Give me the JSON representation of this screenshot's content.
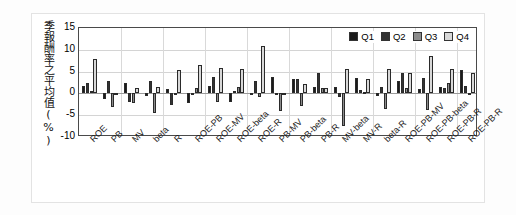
{
  "chart_data": {
    "type": "bar",
    "title": "",
    "xlabel": "",
    "ylabel": "季報酬率之平均值(%)",
    "ylim": [
      -10,
      15
    ],
    "yticks": [
      15,
      10,
      5,
      0,
      -5,
      -10
    ],
    "grid": true,
    "legend_position": "top-right-inside",
    "categories": [
      "ROE",
      "PB",
      "MV",
      "beta",
      "R",
      "ROE-PB",
      "ROE-MV",
      "ROE-beta",
      "ROE-R",
      "PB-MV",
      "PB-beta",
      "PB-R",
      "MV-beta",
      "MV-R",
      "beta-R",
      "ROE-PB-MV",
      "ROE-PB-beta",
      "ROE-PB-R",
      "ROE-PB-R2"
    ],
    "series": [
      {
        "name": "Q1",
        "color": "#1a1a1a",
        "values": [
          1.6,
          -1.2,
          2.5,
          -0.5,
          0.9,
          -2.2,
          1.8,
          -2.0,
          -0.3,
          3.8,
          3.2,
          1.5,
          1.4,
          3.6,
          -0.6,
          2.8,
          1.0,
          1.5,
          5.3
        ]
      },
      {
        "name": "Q2",
        "color": "#333333",
        "values": [
          2.4,
          2.8,
          -1.9,
          2.9,
          -2.6,
          -0.3,
          3.7,
          0.6,
          2.8,
          -0.2,
          3.2,
          4.6,
          -0.8,
          0.7,
          1.4,
          4.6,
          3.5,
          1.2,
          1.6
        ]
      },
      {
        "name": "Q3",
        "color": "#8c8c8c",
        "values": [
          0.5,
          -3.2,
          -2.2,
          -4.5,
          -0.4,
          1.2,
          -2.0,
          1.5,
          -0.9,
          -4.0,
          -2.9,
          1.2,
          -7.5,
          0.4,
          -3.5,
          1.3,
          -3.9,
          2.4,
          -0.4
        ]
      },
      {
        "name": "Q4",
        "color": "#d8d8d8",
        "values": [
          8.0,
          0.0,
          1.2,
          1.5,
          5.3,
          6.6,
          5.8,
          5.5,
          10.8,
          0.1,
          2.1,
          1.3,
          5.6,
          3.2,
          5.5,
          4.6,
          8.5,
          5.6,
          4.7
        ]
      }
    ]
  },
  "legend": {
    "items": [
      {
        "label": "Q1",
        "color": "#1a1a1a"
      },
      {
        "label": "Q2",
        "color": "#333333"
      },
      {
        "label": "Q3",
        "color": "#8c8c8c"
      },
      {
        "label": "Q4",
        "color": "#d8d8d8"
      }
    ]
  }
}
